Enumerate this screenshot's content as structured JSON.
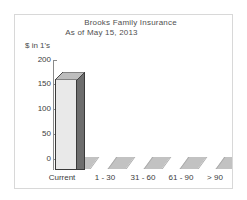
{
  "chart_data": {
    "type": "bar",
    "title": "Brooks Family Insurance",
    "subtitle": "As of May 15, 2013",
    "ylabel": "$ in 1's",
    "xlabel": "",
    "categories": [
      "Current",
      "1 - 30",
      "31 - 60",
      "61 - 90",
      "> 90"
    ],
    "values": [
      165,
      0,
      0,
      0,
      0
    ],
    "series": [
      {
        "name": "Balance",
        "values": [
          165,
          0,
          0,
          0,
          0
        ]
      }
    ],
    "ylim": [
      0,
      200
    ],
    "yticks": [
      0,
      50,
      100,
      150,
      200
    ],
    "ytick_labels": [
      "0",
      "50",
      "100",
      "150",
      "200"
    ],
    "grid": false,
    "legend": "none",
    "style": "3d-column",
    "colors": {
      "bar_front": "#e9e9e9",
      "bar_side": "#6d6d6d",
      "bar_top": "#bdbdbd",
      "bar_outline": "#3a3a3a",
      "axis": "#8a8a8a",
      "text": "#3d3d3d",
      "title_text": "#505050",
      "frame_border": "#d8d8d8",
      "floor_light": "#ffffff",
      "floor_dark": "#c2c2c2"
    }
  },
  "axis": {
    "unit_label": "$ in 1's",
    "y_labels": [
      "200",
      "150",
      "100",
      "50",
      "0"
    ],
    "x_labels": [
      "Current",
      "1 - 30",
      "31 - 60",
      "61 - 90",
      "> 90"
    ]
  },
  "header": {
    "title": "Brooks Family Insurance",
    "subtitle": "As of May 15, 2013"
  }
}
